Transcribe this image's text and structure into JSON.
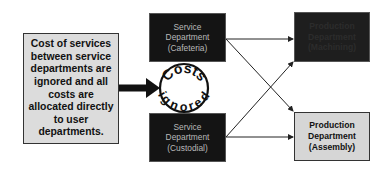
{
  "note": {
    "text": "Cost of services\nbetween service\ndepartments are\nignored and all\ncosts are\nallocated directly\nto user\ndepartments."
  },
  "service_departments": [
    {
      "label": "Service\nDepartment\n(Cafeteria)"
    },
    {
      "label": "Service\nDepartment\n(Custodial)"
    }
  ],
  "production_departments": [
    {
      "label": "Production\nDepartment\n(Machining)"
    },
    {
      "label": "Production\nDepartment\n(Assembly)"
    }
  ],
  "stamp": {
    "top_word": "Costs",
    "bottom_word": "ignored"
  },
  "colors": {
    "dark_box": "#141414",
    "light_box": "#dcdcdc",
    "line": "#222222"
  }
}
